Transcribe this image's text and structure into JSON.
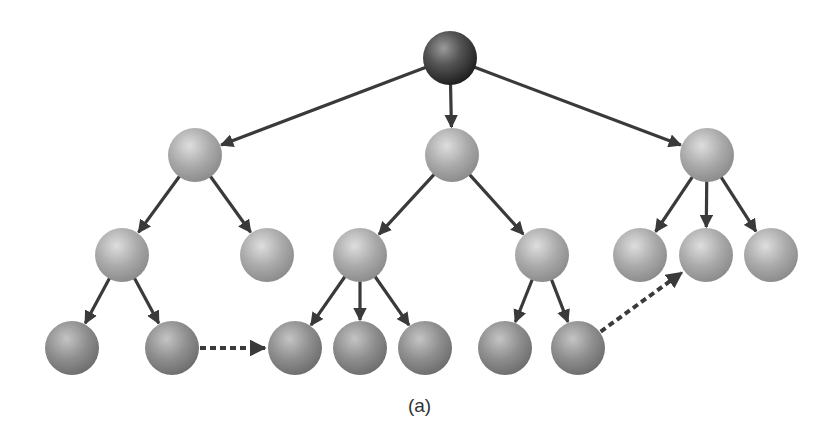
{
  "caption": "(a)",
  "colors": {
    "edge": "#3a3a3a",
    "root_node": "#4a4a4a",
    "inner_node": "#a8a8a8",
    "leaf_node": "#8e8e8e",
    "background": "#ffffff"
  },
  "node_radius": 27,
  "nodes": [
    {
      "id": "root",
      "x": 450,
      "y": 58,
      "kind": "root"
    },
    {
      "id": "a",
      "x": 195,
      "y": 155,
      "kind": "inner"
    },
    {
      "id": "b",
      "x": 452,
      "y": 155,
      "kind": "inner"
    },
    {
      "id": "c",
      "x": 707,
      "y": 155,
      "kind": "inner"
    },
    {
      "id": "a1",
      "x": 122,
      "y": 255,
      "kind": "inner"
    },
    {
      "id": "a2",
      "x": 267,
      "y": 255,
      "kind": "inner"
    },
    {
      "id": "b1",
      "x": 360,
      "y": 255,
      "kind": "inner"
    },
    {
      "id": "b2",
      "x": 542,
      "y": 255,
      "kind": "inner"
    },
    {
      "id": "c1",
      "x": 640,
      "y": 255,
      "kind": "inner"
    },
    {
      "id": "c2",
      "x": 706,
      "y": 255,
      "kind": "inner"
    },
    {
      "id": "c3",
      "x": 771,
      "y": 255,
      "kind": "inner"
    },
    {
      "id": "a1a",
      "x": 72,
      "y": 348,
      "kind": "leaf"
    },
    {
      "id": "a1b",
      "x": 172,
      "y": 348,
      "kind": "leaf"
    },
    {
      "id": "b1a",
      "x": 295,
      "y": 348,
      "kind": "leaf"
    },
    {
      "id": "b1b",
      "x": 360,
      "y": 348,
      "kind": "leaf"
    },
    {
      "id": "b1c",
      "x": 425,
      "y": 348,
      "kind": "leaf"
    },
    {
      "id": "b2a",
      "x": 505,
      "y": 348,
      "kind": "leaf"
    },
    {
      "id": "b2b",
      "x": 578,
      "y": 348,
      "kind": "leaf"
    }
  ],
  "edges": [
    {
      "from": "root",
      "to": "a"
    },
    {
      "from": "root",
      "to": "b"
    },
    {
      "from": "root",
      "to": "c"
    },
    {
      "from": "a",
      "to": "a1"
    },
    {
      "from": "a",
      "to": "a2"
    },
    {
      "from": "b",
      "to": "b1"
    },
    {
      "from": "b",
      "to": "b2"
    },
    {
      "from": "c",
      "to": "c1"
    },
    {
      "from": "c",
      "to": "c2"
    },
    {
      "from": "c",
      "to": "c3"
    },
    {
      "from": "a1",
      "to": "a1a"
    },
    {
      "from": "a1",
      "to": "a1b"
    },
    {
      "from": "b1",
      "to": "b1a"
    },
    {
      "from": "b1",
      "to": "b1b"
    },
    {
      "from": "b1",
      "to": "b1c"
    },
    {
      "from": "b2",
      "to": "b2a"
    },
    {
      "from": "b2",
      "to": "b2b"
    }
  ],
  "dashed_edges": [
    {
      "from": "a1b",
      "to": "b1a"
    },
    {
      "from": "b2b",
      "to": "c2"
    }
  ]
}
